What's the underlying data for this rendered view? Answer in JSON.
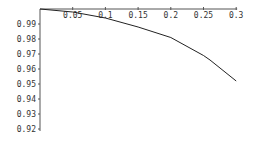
{
  "chart_data": {
    "type": "line",
    "title": "",
    "xlabel": "",
    "ylabel": "",
    "xlim": [
      0,
      0.3
    ],
    "ylim": [
      0.92,
      1.0
    ],
    "x_ticks": [
      "0.05",
      "0.1",
      "0.15",
      "0.2",
      "0.25",
      "0.3"
    ],
    "y_ticks": [
      "0.99",
      "0.98",
      "0.97",
      "0.96",
      "0.95",
      "0.94",
      "0.93",
      "0.92"
    ],
    "grid": false,
    "legend": null,
    "x_axis_position": "top",
    "series": [
      {
        "name": "curve",
        "x": [
          0,
          0.05,
          0.1,
          0.15,
          0.2,
          0.25,
          0.26,
          0.3
        ],
        "y": [
          1.0,
          0.998,
          0.994,
          0.988,
          0.981,
          0.969,
          0.966,
          0.952
        ]
      }
    ]
  },
  "style": {
    "line_color": "#222222",
    "axis_color": "#555555"
  }
}
